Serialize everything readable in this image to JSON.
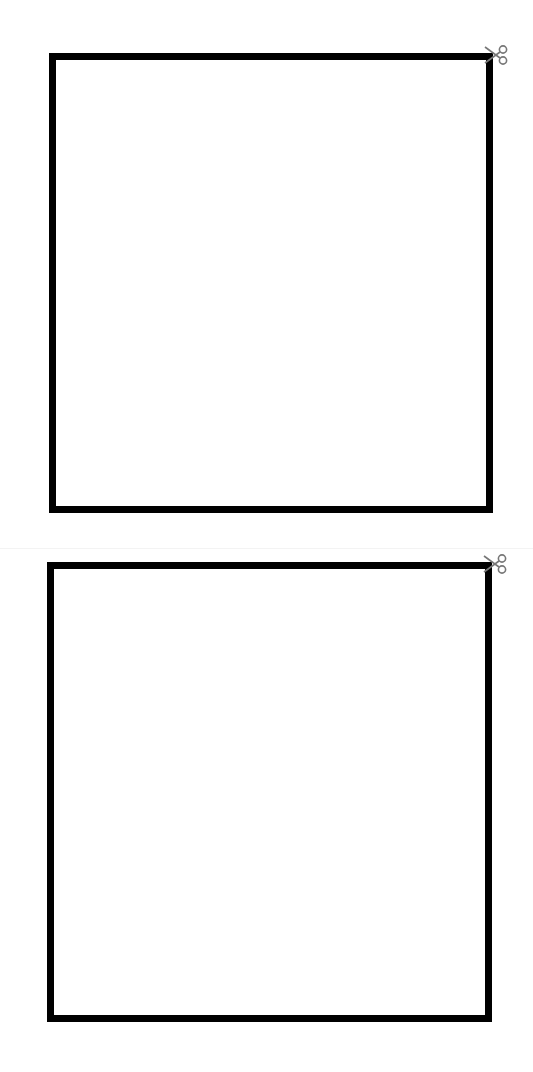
{
  "page": {
    "type": "cut-out template",
    "background": "#ffffff",
    "border_color": "#000000",
    "icon_color": "#777777"
  },
  "boxes": [
    {
      "id": "box1",
      "icon": "scissors-icon",
      "label": ""
    },
    {
      "id": "box2",
      "icon": "scissors-icon",
      "label": ""
    }
  ]
}
